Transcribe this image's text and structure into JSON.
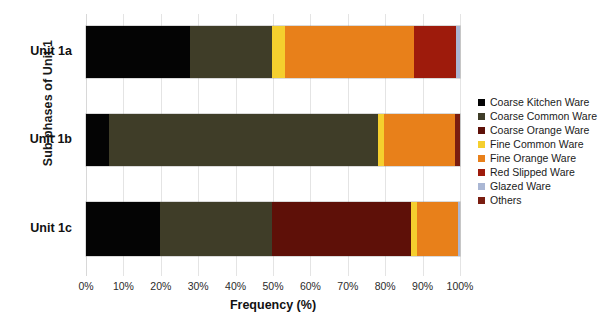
{
  "chart_data": {
    "type": "bar",
    "orientation": "horizontal",
    "stacked": true,
    "stack_mode": "percent",
    "title": "",
    "xlabel": "Frequency (%)",
    "ylabel": "Sub-phases of Unit 1",
    "xlim": [
      0,
      100
    ],
    "xticks": [
      "0%",
      "10%",
      "20%",
      "30%",
      "40%",
      "50%",
      "60%",
      "70%",
      "80%",
      "90%",
      "100%"
    ],
    "xtick_values": [
      0,
      10,
      20,
      30,
      40,
      50,
      60,
      70,
      80,
      90,
      100
    ],
    "grid": true,
    "grid_axis": "x",
    "legend_position": "right",
    "categories": [
      "Unit 1a",
      "Unit 1b",
      "Unit 1c"
    ],
    "series": [
      {
        "name": "Coarse Kitchen Ware",
        "color": "#040404",
        "values": [
          27.8,
          6.2,
          19.8
        ]
      },
      {
        "name": "Coarse Common Ware",
        "color": "#3f3d28",
        "values": [
          21.9,
          71.9,
          29.9
        ]
      },
      {
        "name": "Coarse Orange Ware",
        "color": "#5e1008",
        "values": [
          0,
          0,
          37.2
        ]
      },
      {
        "name": "Fine Common Ware",
        "color": "#f5cf2e",
        "values": [
          3.5,
          1.6,
          1.6
        ]
      },
      {
        "name": "Fine Orange Ware",
        "color": "#e8801a",
        "values": [
          34.5,
          19.0,
          11.0
        ]
      },
      {
        "name": "Red Slipped Ware",
        "color": "#9e1b0c",
        "values": [
          11.2,
          0,
          0
        ]
      },
      {
        "name": "Glazed Ware",
        "color": "#aab7d4",
        "values": [
          1.1,
          0,
          0.5
        ]
      },
      {
        "name": "Others",
        "color": "#7a1d10",
        "values": [
          0,
          1.3,
          0
        ]
      }
    ]
  },
  "axis": {
    "x_title": "Frequency (%)",
    "y_title": "Sub-phases of Unit 1"
  }
}
